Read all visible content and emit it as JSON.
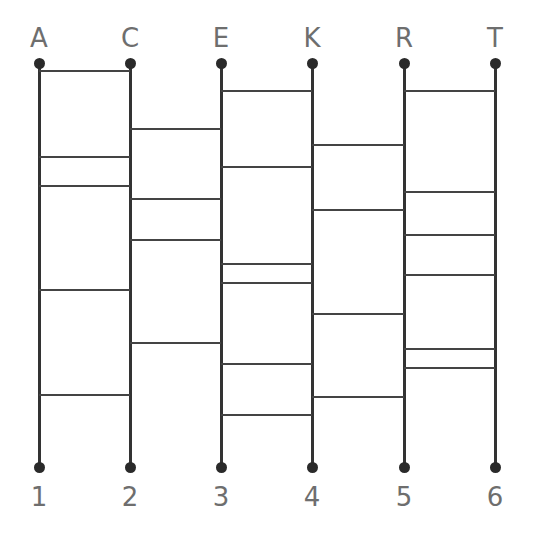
{
  "diagram": {
    "type": "ladder-puzzle",
    "line_color": "#333333",
    "label_color": "#6e6e6e",
    "top_y": 63,
    "bottom_y": 467,
    "columns": [
      {
        "top_label": "A",
        "bottom_label": "1",
        "x": 39
      },
      {
        "top_label": "C",
        "bottom_label": "2",
        "x": 130
      },
      {
        "top_label": "E",
        "bottom_label": "3",
        "x": 221
      },
      {
        "top_label": "K",
        "bottom_label": "4",
        "x": 312
      },
      {
        "top_label": "R",
        "bottom_label": "5",
        "x": 404
      },
      {
        "top_label": "T",
        "bottom_label": "6",
        "x": 495
      }
    ],
    "rungs": [
      {
        "between": [
          0,
          1
        ],
        "y": [
          71,
          157,
          186,
          290,
          395
        ]
      },
      {
        "between": [
          1,
          2
        ],
        "y": [
          129,
          199,
          240,
          343
        ]
      },
      {
        "between": [
          2,
          3
        ],
        "y": [
          91,
          167,
          264,
          283,
          364,
          415
        ]
      },
      {
        "between": [
          3,
          4
        ],
        "y": [
          145,
          210,
          314,
          397
        ]
      },
      {
        "between": [
          4,
          5
        ],
        "y": [
          91,
          192,
          235,
          275,
          349,
          368
        ]
      }
    ]
  }
}
